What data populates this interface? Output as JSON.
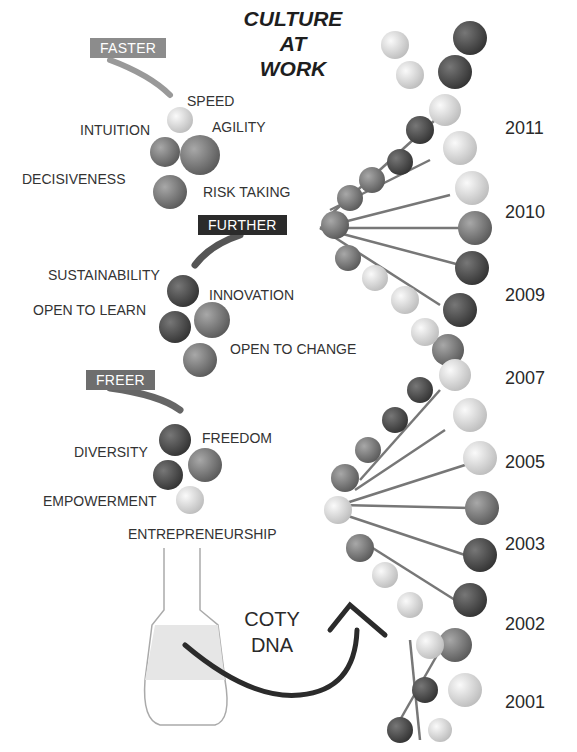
{
  "title": {
    "line1": "CULTURE",
    "line2": "AT",
    "line3": "WORK"
  },
  "groups": [
    {
      "tag": "FASTER",
      "tag_color": "#8c8c8c",
      "values": [
        "SPEED",
        "INTUITION",
        "AGILITY",
        "DECISIVENESS",
        "RISK TAKING"
      ]
    },
    {
      "tag": "FURTHER",
      "tag_color": "#2b2b2b",
      "values": [
        "SUSTAINABILITY",
        "INNOVATION",
        "OPEN TO LEARN",
        "OPEN TO CHANGE"
      ]
    },
    {
      "tag": "FREER",
      "tag_color": "#6e6e6e",
      "values": [
        "FREEDOM",
        "DIVERSITY",
        "EMPOWERMENT",
        "ENTREPRENEURSHIP"
      ]
    }
  ],
  "flask_label": {
    "line1": "COTY",
    "line2": "DNA"
  },
  "years": [
    "2011",
    "2010",
    "2009",
    "2007",
    "2005",
    "2003",
    "2002",
    "2001"
  ],
  "colors": {
    "text": "#2a2a2a",
    "helix_dark": "#555555",
    "helix_light": "#dcdcdc"
  }
}
